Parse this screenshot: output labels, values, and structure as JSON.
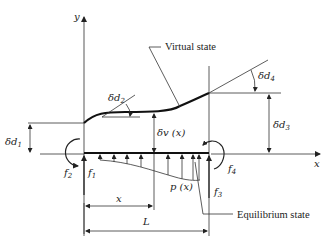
{
  "figure": {
    "axes": {
      "x_label": "x",
      "y_label": "y"
    },
    "states": {
      "virtual": "Virtual state",
      "equilibrium": "Equilibrium state"
    },
    "displacements": {
      "d1": "δd",
      "d1_sub": "1",
      "d2": "δd",
      "d2_sub": "2",
      "d3": "δd",
      "d3_sub": "3",
      "d4": "δd",
      "d4_sub": "4",
      "v": "δv (x)"
    },
    "forces": {
      "f1": "f",
      "f1_sub": "1",
      "f2": "f",
      "f2_sub": "2",
      "f3": "f",
      "f3_sub": "3",
      "f4": "f",
      "f4_sub": "4"
    },
    "load": "p (x)",
    "dimensions": {
      "x": "x",
      "L": "L"
    }
  }
}
